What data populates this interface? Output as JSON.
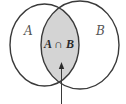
{
  "diagram": {
    "type": "venn",
    "sets": [
      {
        "id": "A",
        "label": "A"
      },
      {
        "id": "B",
        "label": "B"
      }
    ],
    "intersection": {
      "label": "A ∩ B",
      "highlighted": true
    },
    "pointer": "arrow-up-to-intersection"
  },
  "colors": {
    "stroke": "#3a3a3a",
    "intersection_fill": "#d4d4d4",
    "background": "#ffffff",
    "set_label": "#555555",
    "intersection_label": "#2a2a2a"
  }
}
